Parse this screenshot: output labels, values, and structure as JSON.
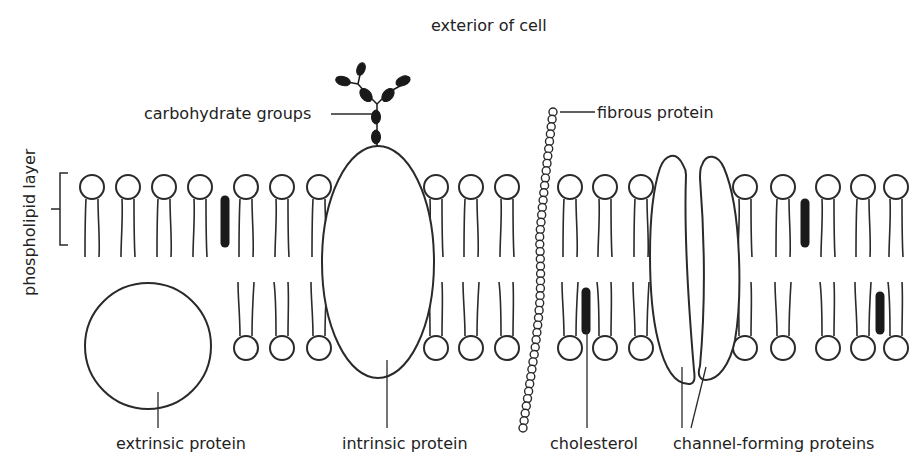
{
  "title": "exterior of cell",
  "labels": {
    "carbohydrate_groups": "carbohydrate groups",
    "fibrous_protein": "fibrous protein",
    "phospholipid_layer": "phospholipid layer",
    "extrinsic_protein": "extrinsic protein",
    "intrinsic_protein": "intrinsic protein",
    "cholesterol": "cholesterol",
    "channel_forming_proteins": "channel-forming proteins"
  },
  "colors": {
    "stroke": "#2a2a2a",
    "fill_dark": "#1a1a1a",
    "background": "#ffffff",
    "text": "#222222"
  },
  "membrane": {
    "top_head_y": 187,
    "bottom_head_y": 348,
    "head_radius": 12,
    "top_heads_x": [
      92,
      128,
      164,
      200,
      246,
      282,
      319,
      436,
      471,
      507,
      570,
      605,
      641,
      745,
      783,
      828,
      863,
      896
    ],
    "bottom_heads_x": [
      246,
      282,
      319,
      436,
      471,
      507,
      570,
      605,
      641,
      745,
      783,
      828,
      863,
      896
    ],
    "cholesterol": [
      {
        "x": 225,
        "y1": 200,
        "y2": 243,
        "layer": "top"
      },
      {
        "x": 586,
        "y1": 292,
        "y2": 330,
        "layer": "bottom"
      },
      {
        "x": 805,
        "y1": 203,
        "y2": 243,
        "layer": "top"
      },
      {
        "x": 880,
        "y1": 296,
        "y2": 330,
        "layer": "bottom"
      }
    ]
  }
}
